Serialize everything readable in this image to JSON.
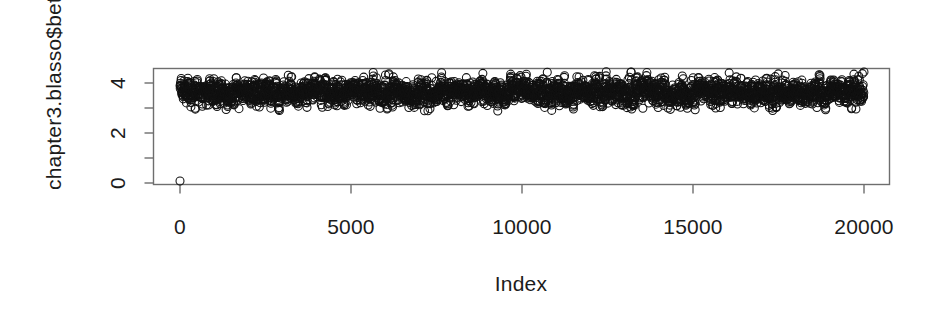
{
  "figure": {
    "background_color": "#ffffff",
    "foreground_color": "#1c1c1c",
    "width": 942,
    "height": 316
  },
  "chart_data": {
    "type": "scatter",
    "title": "",
    "subtitle": "",
    "xlabel": "Index",
    "ylabel": "chapter3.blasso$beta[",
    "xlim": [
      -400,
      20400
    ],
    "ylim": [
      -0.12,
      4.7
    ],
    "xticks": [
      0,
      5000,
      10000,
      15000,
      20000
    ],
    "xtick_labels": [
      "0",
      "5000",
      "10000",
      "15000",
      "20000"
    ],
    "yticks": [
      0,
      1,
      2,
      3,
      4
    ],
    "ytick_labels": [
      "0",
      "",
      "2",
      "",
      "4"
    ],
    "grid": false,
    "legend": false,
    "legend_position": "none",
    "box": "full",
    "marker": "open-circle",
    "marker_size": 4,
    "marker_color": "#111111",
    "series": [
      {
        "name": "chapter3.blasso$beta[",
        "n_points": 20001,
        "description": "MCMC trace: single point at index 0 with value ~0.08, then a dense stationary band from index 1 to 20000 oscillating about a mean of ~3.6",
        "initial_point": {
          "x": 0,
          "y": 0.08
        },
        "stationary": {
          "x_start": 1,
          "x_end": 20000,
          "mean": 3.62,
          "sd": 0.27,
          "min": 2.88,
          "max": 4.45
        }
      }
    ]
  },
  "axes": {
    "x_tick_labels": [
      "0",
      "5000",
      "10000",
      "15000",
      "20000"
    ],
    "y_tick_labels": [
      "0",
      "2",
      "4"
    ],
    "x_title": "Index",
    "y_title": "chapter3.blasso$beta["
  }
}
